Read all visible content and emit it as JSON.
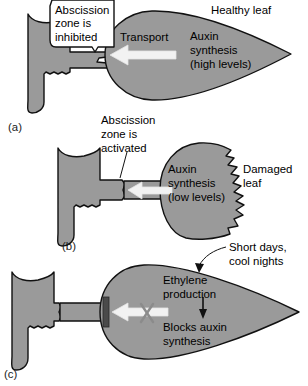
{
  "figure": {
    "colors": {
      "leaf_fill": "#9a9a9a",
      "leaf_stroke": "#111111",
      "arrow_fill": "#f2f2f2",
      "arrow_stroke": "#e8e8e8",
      "block_bar": "#4a4a4a",
      "x_mark": "#8b8b8b",
      "background": "#ffffff",
      "text": "#000000"
    },
    "panels": [
      {
        "tag": "(a)",
        "name": "healthy-leaf-panel",
        "labels": {
          "abscission_zone": "Abscission\nzone is\ninhibited",
          "abscission_zone_line1": "Abscission",
          "abscission_zone_line2": "zone is",
          "abscission_zone_line3": "inhibited",
          "leaf_state": "Healthy leaf",
          "transport": "Transport",
          "synthesis_line1": "Auxin",
          "synthesis_line2": "synthesis",
          "synthesis_line3": "(high levels)"
        }
      },
      {
        "tag": "(b)",
        "name": "damaged-leaf-panel",
        "labels": {
          "abscission_zone_line1": "Abscission",
          "abscission_zone_line2": "zone is",
          "abscission_zone_line3": "activated",
          "leaf_state_line1": "Damaged",
          "leaf_state_line2": "leaf",
          "synthesis_line1": "Auxin",
          "synthesis_line2": "synthesis",
          "synthesis_line3": "(low levels)"
        }
      },
      {
        "tag": "(c)",
        "name": "ethylene-panel",
        "labels": {
          "trigger_line1": "Short days,",
          "trigger_line2": "cool nights",
          "ethylene_line1": "Ethylene",
          "ethylene_line2": "production",
          "blocks_line1": "Blocks auxin",
          "blocks_line2": "synthesis"
        }
      }
    ],
    "caption_fragment": " "
  }
}
